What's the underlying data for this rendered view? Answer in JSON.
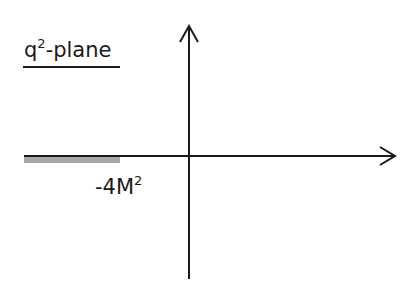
{
  "diagram": {
    "title": {
      "base": "q",
      "superscript": "2",
      "suffix": "-plane"
    },
    "axes": {
      "horizontal": {
        "direction": "right",
        "arrow": true
      },
      "vertical": {
        "direction": "up",
        "arrow": true
      }
    },
    "branch_cut": {
      "label_base": "-4M",
      "label_superscript": "2",
      "color": "#a8a8a8",
      "extends": "negative real axis from -4M^2 to -infinity"
    },
    "colors": {
      "line": "#1a1a1a",
      "cut_fill": "#a8a8a8"
    }
  }
}
